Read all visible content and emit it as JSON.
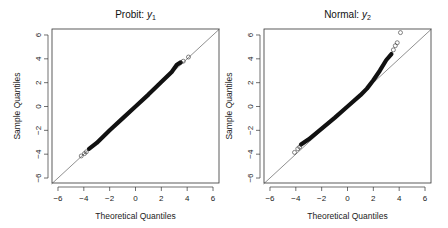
{
  "chart_data": [
    {
      "type": "scatter",
      "subtype": "qq-plot",
      "title": "Probit: y1",
      "title_main": "Probit: ",
      "title_var": "y",
      "title_sub": "1",
      "xlabel": "Theoretical Quantiles",
      "ylabel": "Sample Quantiles",
      "xlim": [
        -6.5,
        6.5
      ],
      "ylim": [
        -6.5,
        6.5
      ],
      "xticks": [
        -6,
        -4,
        -2,
        0,
        2,
        4,
        6
      ],
      "yticks": [
        -6,
        -4,
        -2,
        0,
        2,
        4,
        6
      ],
      "reference_line": {
        "slope": 1,
        "intercept": 0
      },
      "grid": false,
      "points_summary": "dense points closely following y=x from about -3.6 to 3.4, with sparse open-circle tails",
      "curve": [
        [
          -3.6,
          -3.55
        ],
        [
          -3.0,
          -3.05
        ],
        [
          -2.0,
          -2.0
        ],
        [
          -1.0,
          -1.0
        ],
        [
          0.0,
          0.0
        ],
        [
          1.0,
          1.0
        ],
        [
          2.0,
          2.05
        ],
        [
          2.8,
          2.9
        ],
        [
          3.2,
          3.5
        ],
        [
          3.5,
          3.7
        ]
      ],
      "outliers": [
        [
          -4.2,
          -4.15
        ],
        [
          -3.95,
          -3.95
        ],
        [
          -3.8,
          -3.8
        ],
        [
          3.7,
          3.8
        ],
        [
          4.1,
          4.15
        ]
      ]
    },
    {
      "type": "scatter",
      "subtype": "qq-plot",
      "title": "Normal: y2",
      "title_main": "Normal: ",
      "title_var": "y",
      "title_sub": "2",
      "xlabel": "Theoretical Quantiles",
      "ylabel": "Sample Quantiles",
      "xlim": [
        -6.5,
        6.5
      ],
      "ylim": [
        -6.5,
        6.5
      ],
      "xticks": [
        -6,
        -4,
        -2,
        0,
        2,
        4,
        6
      ],
      "yticks": [
        -6,
        -4,
        -2,
        0,
        2,
        4,
        6
      ],
      "reference_line": {
        "slope": 1,
        "intercept": 0
      },
      "grid": false,
      "points_summary": "points lie above y=x in both tails (left tail lighter, right tail heavier), right-skewed",
      "curve": [
        [
          -3.6,
          -3.2
        ],
        [
          -3.0,
          -2.75
        ],
        [
          -2.0,
          -1.85
        ],
        [
          -1.0,
          -0.95
        ],
        [
          0.0,
          0.0
        ],
        [
          1.0,
          0.95
        ],
        [
          1.5,
          1.5
        ],
        [
          2.0,
          2.2
        ],
        [
          2.5,
          3.0
        ],
        [
          3.0,
          3.9
        ],
        [
          3.4,
          4.4
        ]
      ],
      "outliers": [
        [
          -4.1,
          -3.85
        ],
        [
          -3.85,
          -3.55
        ],
        [
          -3.7,
          -3.4
        ],
        [
          3.55,
          4.75
        ],
        [
          3.7,
          5.1
        ],
        [
          3.85,
          5.35
        ],
        [
          4.1,
          6.2
        ]
      ]
    }
  ],
  "plots": [
    {
      "title_main": "Probit: ",
      "title_var": "y",
      "title_sub": "1",
      "xlabel": "Theoretical Quantiles",
      "ylabel": "Sample Quantiles"
    },
    {
      "title_main": "Normal: ",
      "title_var": "y",
      "title_sub": "2",
      "xlabel": "Theoretical Quantiles",
      "ylabel": "Sample Quantiles"
    }
  ],
  "colors": {
    "points": "#111111",
    "reference_line": "#444444",
    "axes": "#333333"
  }
}
